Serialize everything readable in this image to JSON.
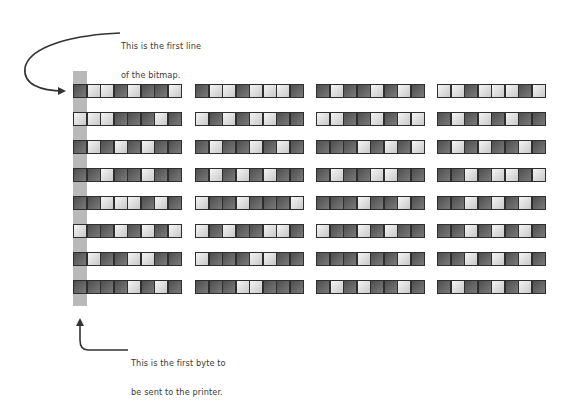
{
  "annotations": {
    "top": {
      "line1": "This is the first line",
      "line2": "of the bitmap."
    },
    "bottom": {
      "line1": "This is the first byte to",
      "line2": "be sent to the printer."
    }
  },
  "colors": {
    "dark_cell": "#5e5e5e",
    "light_cell": "#e6e6e6",
    "cell_border": "#2e2e2e",
    "highlight_column": "#b9b9b9",
    "arrow": "#333333"
  },
  "bitmap": {
    "rows": [
      [
        "DLLDLDDL",
        "DLLDLLLD",
        "DLDDLDLD",
        "LLDLLLDL"
      ],
      [
        "LLLDDDLD",
        "LDLDLLDD",
        "LLDDLDLL",
        "DLDLDLDD"
      ],
      [
        "DLDLDLDD",
        "DLDDLDLD",
        "DDDLDLDL",
        "DLDLDDLD"
      ],
      [
        "DDLDDLDD",
        "DLDLDLDD",
        "DLDDLLDD",
        "DDLDLLDL"
      ],
      [
        "DDLLLDLD",
        "LDDLDDDL",
        "DDDLDDLD",
        "DDLDLDLD"
      ],
      [
        "LDDLDLDL",
        "LDLDDLLD",
        "LDDLDLDD",
        "DDLDLDLD"
      ],
      [
        "DLDDLLDD",
        "LDDDLLDD",
        "DDDLDDLD",
        "DDLDLDLD"
      ],
      [
        "DDDDLDLD",
        "DDDLLDDD",
        "DLDLDDLD",
        "DLDDLDLD"
      ]
    ],
    "legend": {
      "D": "dark (bit on)",
      "L": "light (bit off)"
    }
  }
}
